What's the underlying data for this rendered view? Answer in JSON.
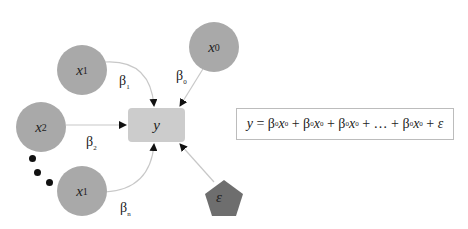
{
  "diagram": {
    "colors": {
      "input_node": "#a9a9a9",
      "output_node": "#cccccc",
      "error_node": "#6e6e6e",
      "edge": "#c8c8c8",
      "arrowhead": "#111111"
    },
    "nodes": [
      {
        "id": "x0",
        "base": "x",
        "sub": "0",
        "shape": "circle"
      },
      {
        "id": "x1_top",
        "base": "x",
        "sub": "1",
        "shape": "circle"
      },
      {
        "id": "x2",
        "base": "x",
        "sub": "2",
        "shape": "circle"
      },
      {
        "id": "x1_bottom",
        "base": "x",
        "sub": "1",
        "shape": "circle"
      },
      {
        "id": "y",
        "label": "y",
        "shape": "rounded-rect"
      },
      {
        "id": "epsilon",
        "label": "ε",
        "shape": "pentagon"
      }
    ],
    "edges": [
      {
        "from": "x0",
        "to": "y",
        "weight_base": "β",
        "weight_sub": "0"
      },
      {
        "from": "x1_top",
        "to": "y",
        "weight_base": "β",
        "weight_sub": "1"
      },
      {
        "from": "x2",
        "to": "y",
        "weight_base": "β",
        "weight_sub": "2"
      },
      {
        "from": "x1_bottom",
        "to": "y",
        "weight_base": "β",
        "weight_sub": "n"
      },
      {
        "from": "epsilon",
        "to": "y"
      }
    ],
    "ellipsis": "•••",
    "equation": {
      "lhs": "y",
      "eq": " = ",
      "terms": [
        {
          "coef": "β",
          "coef_sub": "0",
          "var": "x",
          "var_sub": "0"
        },
        {
          "coef": "β",
          "coef_sub": "0",
          "var": "x",
          "var_sub": "0"
        },
        {
          "coef": "β",
          "coef_sub": "0",
          "var": "x",
          "var_sub": "0"
        },
        {
          "coef": "β",
          "coef_sub": "0",
          "var": "x",
          "var_sub": "0"
        }
      ],
      "plus": " + ",
      "ellipsis": "…",
      "error": "ε",
      "full_text": "y = β0x0 + β0x0 + β0x0 + … + β0x0 + ε"
    }
  }
}
